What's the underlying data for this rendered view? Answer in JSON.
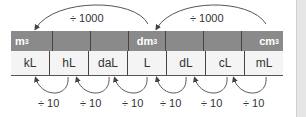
{
  "diagram": {
    "title_arrows_top": [
      {
        "label": "÷ 1000",
        "from": "dm³",
        "to": "m³"
      },
      {
        "label": "÷ 1000",
        "from": "cm³",
        "to": "dm³"
      }
    ],
    "header_row": [
      {
        "text": "m",
        "sup": "3"
      },
      {
        "text": "",
        "sup": ""
      },
      {
        "text": "",
        "sup": ""
      },
      {
        "text": "dm",
        "sup": "3"
      },
      {
        "text": "",
        "sup": ""
      },
      {
        "text": "",
        "sup": ""
      },
      {
        "text": "cm",
        "sup": "3"
      }
    ],
    "units_row": [
      "kL",
      "hL",
      "daL",
      "L",
      "dL",
      "cL",
      "mL"
    ],
    "bottom_arrows": [
      {
        "label": "÷ 10"
      },
      {
        "label": "÷ 10"
      },
      {
        "label": "÷ 10"
      },
      {
        "label": "÷ 10"
      },
      {
        "label": "÷ 10"
      },
      {
        "label": "÷ 10"
      }
    ],
    "colors": {
      "header_bg": "#8a8a8a",
      "body_bg": "#f4f4f4",
      "arrow": "#444444"
    }
  }
}
